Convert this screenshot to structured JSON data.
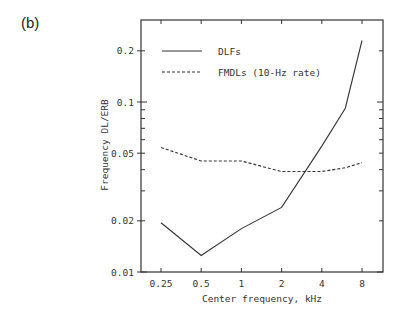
{
  "panel_label": "(b)",
  "chart_data": {
    "type": "line",
    "title": "",
    "xlabel": "Center frequency, kHz",
    "ylabel": "Frequency DL/ERB",
    "xscale": "log",
    "yscale": "log",
    "x_tick_labels": [
      "0.25",
      "0.5",
      "1",
      "2",
      "4",
      "8"
    ],
    "x_ticks": [
      0.25,
      0.5,
      1,
      2,
      4,
      8
    ],
    "y_tick_labels": [
      "0.01",
      "0.02",
      "0.05",
      "0.1",
      "0.2"
    ],
    "y_ticks": [
      0.01,
      0.02,
      0.05,
      0.1,
      0.2
    ],
    "ylim": [
      0.01,
      0.28
    ],
    "grid": false,
    "legend_position": "upper left",
    "series": [
      {
        "name": "DLFs",
        "style": "solid",
        "x": [
          0.25,
          0.5,
          1,
          2,
          4,
          6,
          8
        ],
        "values": [
          0.0195,
          0.0125,
          0.018,
          0.024,
          0.055,
          0.092,
          0.23
        ]
      },
      {
        "name": "FMDLs (10-Hz rate)",
        "style": "dashed",
        "x": [
          0.25,
          0.5,
          1,
          2,
          4,
          6,
          8
        ],
        "values": [
          0.054,
          0.045,
          0.045,
          0.039,
          0.039,
          0.041,
          0.044
        ]
      }
    ]
  }
}
